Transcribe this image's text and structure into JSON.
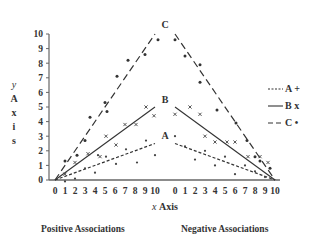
{
  "chart_data": {
    "type": "scatter",
    "title": "",
    "xlabel": "x Axis",
    "ylabel": "y Axis",
    "ylim": [
      0,
      10
    ],
    "yticks": [
      0,
      1,
      2,
      3,
      4,
      5,
      6,
      7,
      8,
      9,
      10
    ],
    "panels": [
      {
        "name": "Positive Associations",
        "xlim": [
          0,
          10
        ],
        "xticks": [
          0,
          1,
          2,
          3,
          4,
          5,
          6,
          7,
          8,
          9,
          10
        ],
        "series": [
          {
            "name": "A",
            "marker": "+",
            "line_style": "short-dash",
            "line": [
              [
                0,
                0
              ],
              [
                10,
                2.5
              ]
            ],
            "points": [
              [
                1,
                -0.1
              ],
              [
                2,
                0.1
              ],
              [
                3,
                0.8
              ],
              [
                4,
                0.5
              ],
              [
                4.3,
                1.7
              ],
              [
                5.1,
                1.6
              ],
              [
                6.1,
                1.1
              ],
              [
                7.1,
                2.1
              ],
              [
                8.2,
                1.2
              ],
              [
                9.1,
                2.7
              ],
              [
                10,
                1.7
              ]
            ]
          },
          {
            "name": "B",
            "marker": "x",
            "line_style": "solid",
            "line": [
              [
                0,
                0
              ],
              [
                10,
                5
              ]
            ],
            "points": [
              [
                1,
                0.4
              ],
              [
                2,
                1.2
              ],
              [
                3.3,
                1.8
              ],
              [
                4.5,
                1.6
              ],
              [
                5.1,
                3.0
              ],
              [
                6.1,
                2.4
              ],
              [
                7,
                3.8
              ],
              [
                8.1,
                3.8
              ],
              [
                9.1,
                5.0
              ],
              [
                9.9,
                4.4
              ]
            ]
          },
          {
            "name": "C",
            "marker": "•",
            "line_style": "long-dash",
            "line": [
              [
                0,
                0
              ],
              [
                10,
                10
              ]
            ],
            "points": [
              [
                1,
                1.3
              ],
              [
                2.2,
                1.7
              ],
              [
                3,
                2.7
              ],
              [
                3.5,
                4.3
              ],
              [
                5.2,
                4.7
              ],
              [
                5,
                5.3
              ],
              [
                6.2,
                7.1
              ],
              [
                7.3,
                8.2
              ],
              [
                9,
                8.6
              ],
              [
                10.3,
                9.6
              ]
            ]
          }
        ],
        "annotations": [
          {
            "text": "C",
            "x": 10,
            "y": 10.6
          },
          {
            "text": "B",
            "x": 10,
            "y": 5.5
          },
          {
            "text": "A",
            "x": 10,
            "y": 3.0
          }
        ]
      },
      {
        "name": "Negative Associations",
        "xlim": [
          0,
          10
        ],
        "xticks": [
          0,
          1,
          2,
          3,
          4,
          5,
          6,
          7,
          8,
          9,
          10
        ],
        "series": [
          {
            "name": "A",
            "marker": "+",
            "line_style": "short-dash",
            "line": [
              [
                0,
                2.5
              ],
              [
                10,
                0
              ]
            ],
            "points": [
              [
                0,
                3.0
              ],
              [
                1,
                2.3
              ],
              [
                2,
                1.4
              ],
              [
                3,
                2.0
              ],
              [
                4,
                1.0
              ],
              [
                5,
                1.6
              ],
              [
                6,
                0.4
              ],
              [
                7,
                1.0
              ],
              [
                8,
                0.6
              ],
              [
                9,
                0.2
              ]
            ]
          },
          {
            "name": "B",
            "marker": "x",
            "line_style": "solid",
            "line": [
              [
                0,
                5
              ],
              [
                10,
                0
              ]
            ],
            "points": [
              [
                0,
                4.5
              ],
              [
                1.5,
                5.0
              ],
              [
                2.5,
                4.5
              ],
              [
                3,
                3.0
              ],
              [
                4,
                2.6
              ],
              [
                5.2,
                2.6
              ],
              [
                6,
                2.6
              ],
              [
                7.3,
                1.6
              ],
              [
                8.5,
                1.6
              ],
              [
                9.3,
                1.2
              ]
            ]
          },
          {
            "name": "C",
            "marker": "•",
            "line_style": "long-dash",
            "line": [
              [
                0,
                10
              ],
              [
                10,
                0
              ]
            ],
            "points": [
              [
                0,
                9.6
              ],
              [
                1,
                8.5
              ],
              [
                2.5,
                7.9
              ],
              [
                2.5,
                6.7
              ],
              [
                4.2,
                4.8
              ],
              [
                6.1,
                3.9
              ],
              [
                7.2,
                2.7
              ],
              [
                8,
                1.6
              ],
              [
                8.5,
                1.3
              ],
              [
                9.5,
                0.8
              ]
            ]
          }
        ],
        "annotations": []
      }
    ],
    "legend": {
      "position": "right",
      "entries": [
        {
          "label": "A",
          "line_style": "short-dash",
          "marker": "+"
        },
        {
          "label": "B",
          "line_style": "solid",
          "marker": "x"
        },
        {
          "label": "C",
          "line_style": "long-dash",
          "marker": "•"
        }
      ]
    },
    "grid": false
  },
  "labels": {
    "y_axis_letters": [
      "y",
      "A",
      "x",
      "i",
      "s"
    ],
    "x_axis_italic": "x",
    "x_axis_word": "Axis",
    "panel_left": "Positive Associations",
    "panel_right": "Negative Associations",
    "legend": [
      {
        "line": "---",
        "text": "A +"
      },
      {
        "line": "—",
        "text": "B x"
      },
      {
        "line": "– ·",
        "text": "C •"
      }
    ]
  }
}
